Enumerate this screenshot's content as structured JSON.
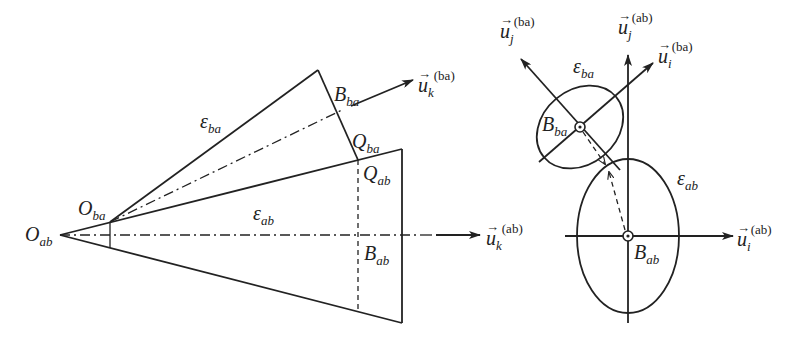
{
  "figure": {
    "left_panel": {
      "labels": {
        "O_ab": {
          "base": "O",
          "sub": "ab"
        },
        "O_ba": {
          "base": "O",
          "sub": "ba"
        },
        "eps_ba": {
          "base": "ε",
          "sub": "ba"
        },
        "eps_ab": {
          "base": "ε",
          "sub": "ab"
        },
        "B_ba": {
          "base": "B",
          "sub": "ba"
        },
        "Q_ba": {
          "base": "Q",
          "sub": "ba"
        },
        "Q_ab": {
          "base": "Q",
          "sub": "ab"
        },
        "B_ab": {
          "base": "B",
          "sub": "ab"
        },
        "uk_ba": {
          "base": "u",
          "sub": "k",
          "sup": "(ba)"
        },
        "uk_ab": {
          "base": "u",
          "sub": "k",
          "sup": "(ab)"
        }
      }
    },
    "right_panel": {
      "labels": {
        "uj_ba": {
          "base": "u",
          "sub": "j",
          "sup": "(ba)"
        },
        "uj_ab": {
          "base": "u",
          "sub": "j",
          "sup": "(ab)"
        },
        "ui_ba": {
          "base": "u",
          "sub": "i",
          "sup": "(ba)"
        },
        "ui_ab": {
          "base": "u",
          "sub": "i",
          "sup": "(ab)"
        },
        "eps_ba": {
          "base": "ε",
          "sub": "ba"
        },
        "eps_ab": {
          "base": "ε",
          "sub": "ab"
        },
        "B_ba": {
          "base": "B",
          "sub": "ba"
        },
        "B_ab": {
          "base": "B",
          "sub": "ab"
        }
      }
    },
    "arrow_glyph": "→"
  }
}
